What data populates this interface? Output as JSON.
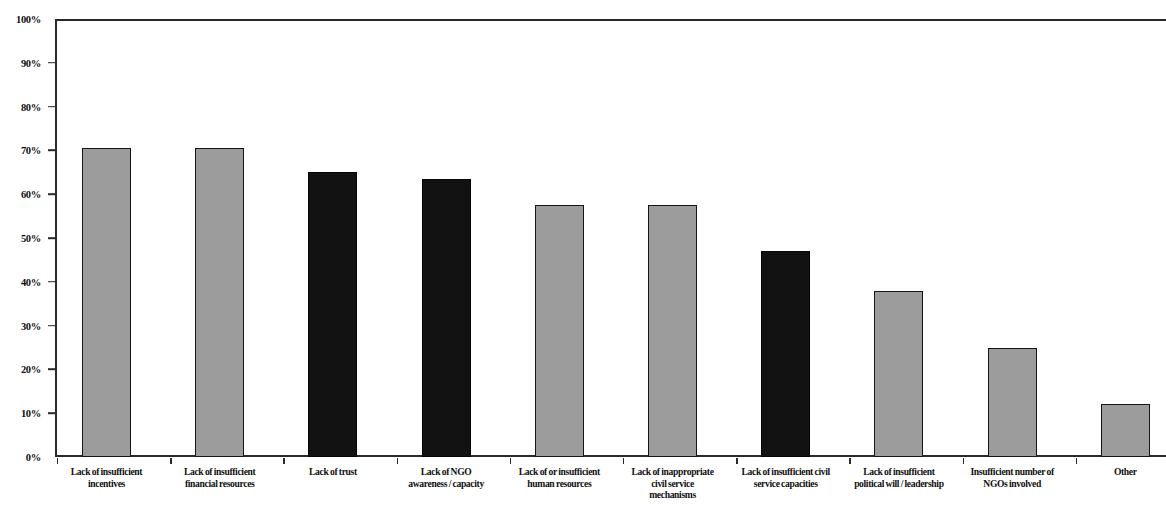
{
  "chart_data": {
    "type": "bar",
    "title": "",
    "subtitle": "",
    "xlabel": "",
    "ylabel": "",
    "ylim": [
      0,
      100
    ],
    "y_tick_labels": [
      "100%",
      "90%",
      "80%",
      "70%",
      "60%",
      "50%",
      "40%",
      "30%",
      "20%",
      "10%",
      "0%"
    ],
    "y_tick_values": [
      100,
      90,
      80,
      70,
      60,
      50,
      40,
      30,
      20,
      10,
      0
    ],
    "grid": false,
    "legend": "none",
    "value_unit": "%",
    "categories": [
      "Lack of insufficient incentives",
      "Lack of insufficient financial resources",
      "Lack of trust",
      "Lack of NGO awareness / capacity",
      "Lack of or insufficient human resources",
      "Lack of inappropriate civil service mechanisms",
      "Lack of insufficient civil service capacities",
      "Lack of insufficient political will / leadership",
      "Insufficient number of NGOs involved",
      "Other"
    ],
    "category_lines": [
      [
        "Lack of insufficient",
        "incentives"
      ],
      [
        "Lack of insufficient",
        "financial resources"
      ],
      [
        "Lack of trust"
      ],
      [
        "Lack of NGO",
        "awareness / capacity"
      ],
      [
        "Lack of or insufficient",
        "human resources"
      ],
      [
        "Lack of inappropriate",
        "civil service",
        "mechanisms"
      ],
      [
        "Lack of insufficient civil",
        "service capacities"
      ],
      [
        "Lack of insufficient",
        "political will / leadership"
      ],
      [
        "Insufficient number of",
        "NGOs involved"
      ],
      [
        "Other"
      ]
    ],
    "values": [
      70.5,
      70.5,
      65,
      63.5,
      57.5,
      57.5,
      47,
      38,
      25,
      12
    ],
    "bar_colors": [
      "#9c9c9c",
      "#9c9c9c",
      "#121212",
      "#121212",
      "#9c9c9c",
      "#9c9c9c",
      "#121212",
      "#9c9c9c",
      "#9c9c9c",
      "#9c9c9c"
    ],
    "bar_shades": [
      "light",
      "light",
      "dark",
      "dark",
      "light",
      "light",
      "dark",
      "light",
      "light",
      "light"
    ],
    "colors": {
      "light_bar": "#9c9c9c",
      "dark_bar": "#121212",
      "axis": "#2a2a2a",
      "text": "#101010",
      "background": "#ffffff"
    }
  }
}
